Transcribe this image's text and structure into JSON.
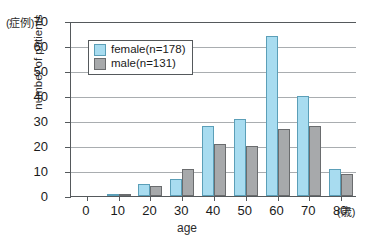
{
  "chart_data": {
    "type": "bar",
    "title": "",
    "xlabel": "age",
    "ylabel": "number of patients",
    "x_unit_caption": "(歳)",
    "y_unit_caption": "(症例)",
    "categories": [
      "0",
      "10",
      "20",
      "30",
      "40",
      "50",
      "60",
      "70",
      "80"
    ],
    "series": [
      {
        "name": "female(n=178)",
        "color": "#a8dcf0",
        "values": [
          0,
          1,
          5,
          7,
          28,
          31,
          64,
          40,
          11
        ]
      },
      {
        "name": "male(n=131)",
        "color": "#a7a9ab",
        "values": [
          0,
          1,
          4,
          11,
          21,
          20,
          27,
          28,
          9
        ]
      }
    ],
    "ylim": [
      0,
      70
    ],
    "yticks": [
      0,
      10,
      20,
      30,
      40,
      50,
      60,
      70
    ],
    "grid": true,
    "legend_position": "upper-left-inside"
  },
  "legend": {
    "items": [
      {
        "label": "female(n=178)",
        "swatch": "female"
      },
      {
        "label": "male(n=131)",
        "swatch": "male"
      }
    ]
  }
}
